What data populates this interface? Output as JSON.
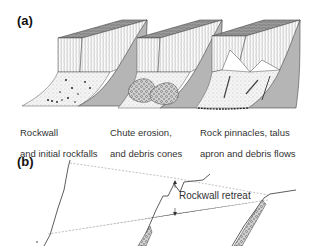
{
  "panel_a": {
    "label": "(a)",
    "stages": [
      {
        "caption_line1": "Rockwall",
        "caption_line2": "and initial rockfalls"
      },
      {
        "caption_line1": "Chute erosion,",
        "caption_line2": "and debris cones"
      },
      {
        "caption_line1": "Rock pinnacles, talus",
        "caption_line2": "apron and  debris flows"
      }
    ]
  },
  "panel_b": {
    "label": "(b)",
    "annotation": "Rockwall retreat"
  }
}
